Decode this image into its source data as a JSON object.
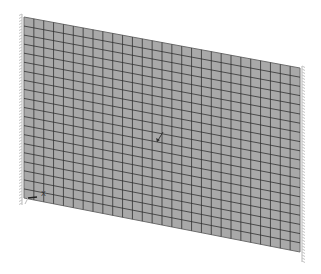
{
  "view": {
    "background": "#ffffff",
    "width": 321,
    "height": 274
  },
  "mesh": {
    "corners": {
      "top_left": [
        24,
        17
      ],
      "top_right": [
        300,
        68
      ],
      "bottom_right": [
        300,
        252
      ],
      "bottom_left": [
        24,
        198
      ]
    },
    "columns": 28,
    "rows": 20,
    "fill_color": "#a9a9a9",
    "line_color": "#2b2b2b",
    "edge_color": "#6e6e6e"
  },
  "supports": {
    "left_edge": {
      "x": 22,
      "y_start": 14,
      "y_end": 205,
      "color": "#c4c4c4"
    },
    "right_edge": {
      "x": 302,
      "y_start": 66,
      "y_end": 262,
      "color": "#c4c4c4"
    }
  },
  "axis_triad": {
    "origin": [
      28,
      198
    ],
    "label": "X",
    "label_pos": [
      41,
      196
    ],
    "color": "#222222"
  },
  "center_marker": {
    "icon": "arrow-icon",
    "from": [
      163,
      132
    ],
    "to": [
      157,
      142
    ],
    "color": "#333333"
  }
}
